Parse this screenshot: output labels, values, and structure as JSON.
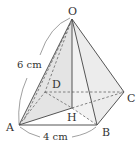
{
  "diagram": {
    "colors": {
      "line": "#555555",
      "shade": "#e6e6e6",
      "text": "#333333"
    },
    "vertices": {
      "O": {
        "label": "O",
        "x": 72,
        "y": 19
      },
      "A": {
        "label": "A",
        "x": 19,
        "y": 125
      },
      "B": {
        "label": "B",
        "x": 97,
        "y": 125
      },
      "C": {
        "label": "C",
        "x": 124,
        "y": 92
      },
      "D": {
        "label": "D",
        "x": 45,
        "y": 92
      },
      "H": {
        "label": "H",
        "x": 72,
        "y": 108
      }
    },
    "labels": {
      "O": "O",
      "A": "A",
      "B": "B",
      "C": "C",
      "D": "D",
      "H": "H"
    },
    "dimensions": {
      "slant_edge": "6 cm",
      "base_edge": "4 cm"
    },
    "solid_edges": [
      "OA",
      "OB",
      "OC",
      "AB",
      "BC",
      "OH"
    ],
    "dashed_edges": [
      "AD",
      "DC",
      "OD",
      "AC",
      "BD"
    ],
    "shaded_faces": [
      "OAH",
      "OBC"
    ]
  }
}
